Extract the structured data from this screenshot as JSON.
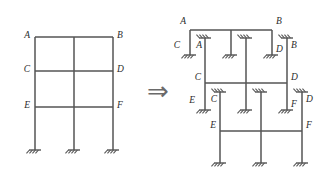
{
  "figure": {
    "type": "structural-engineering-diagram",
    "stroke_color": "#555555",
    "label_color": "#2b2b2b",
    "background": "#ffffff",
    "arrow": {
      "name": "implies-arrow",
      "glyph": "⇒"
    },
    "left_frame": {
      "name": "original-frame",
      "description": "Three-story, two-bay plane frame with three fixed base supports",
      "joint_labels": [
        "A",
        "B",
        "C",
        "D",
        "E",
        "F"
      ],
      "labels": [
        {
          "text": "A",
          "x": 30,
          "y": 38,
          "anchor": "end"
        },
        {
          "text": "B",
          "x": 117,
          "y": 38,
          "anchor": "start"
        },
        {
          "text": "C",
          "x": 30,
          "y": 72,
          "anchor": "end"
        },
        {
          "text": "D",
          "x": 117,
          "y": 72,
          "anchor": "start"
        },
        {
          "text": "E",
          "x": 30,
          "y": 108,
          "anchor": "end"
        },
        {
          "text": "F",
          "x": 117,
          "y": 108,
          "anchor": "start"
        }
      ],
      "columns_x": [
        35,
        74,
        113
      ],
      "beams_y": [
        37,
        71,
        107
      ],
      "base_y": 150,
      "supports": [
        {
          "x": 35,
          "y": 150
        },
        {
          "x": 74,
          "y": 150
        },
        {
          "x": 113,
          "y": 150
        }
      ]
    },
    "right_assembly": {
      "name": "decomposed-substructures",
      "description": "Three one-story substructures, each with fixed supports introduced at the cut column ends",
      "stories": [
        {
          "name": "story-3-substructure",
          "beam_y": 30,
          "beam_x1": 190,
          "beam_x2": 272,
          "columns_x": [
            190,
            231,
            272
          ],
          "column_bottom_y": 55,
          "top_labels": [
            {
              "text": "A",
              "x": 186,
              "y": 24,
              "anchor": "end"
            },
            {
              "text": "B",
              "x": 276,
              "y": 24,
              "anchor": "start"
            }
          ],
          "bottom_labels": [
            {
              "text": "C",
              "x": 180,
              "y": 48,
              "anchor": "end"
            },
            {
              "text": "D",
              "x": 276,
              "y": 52,
              "anchor": "start"
            }
          ],
          "base_supports": [
            {
              "x": 190,
              "y": 55
            },
            {
              "x": 231,
              "y": 55
            },
            {
              "x": 272,
              "y": 55
            }
          ]
        },
        {
          "name": "story-2-substructure",
          "beam_y": 83,
          "beam_x1": 205,
          "beam_x2": 287,
          "columns_x": [
            205,
            246,
            287
          ],
          "column_top_y": 38,
          "column_bottom_y": 110,
          "top_supports": [
            {
              "x": 205,
              "y": 38
            },
            {
              "x": 246,
              "y": 38
            },
            {
              "x": 287,
              "y": 38
            }
          ],
          "top_labels": [
            {
              "text": "A",
              "x": 202,
              "y": 48,
              "anchor": "end"
            },
            {
              "text": "B",
              "x": 291,
              "y": 48,
              "anchor": "start"
            }
          ],
          "mid_labels": [
            {
              "text": "C",
              "x": 201,
              "y": 80,
              "anchor": "end"
            },
            {
              "text": "D",
              "x": 291,
              "y": 80,
              "anchor": "start"
            }
          ],
          "bottom_labels": [
            {
              "text": "E",
              "x": 195,
              "y": 103,
              "anchor": "end"
            },
            {
              "text": "F",
              "x": 291,
              "y": 107,
              "anchor": "start"
            }
          ],
          "base_supports": [
            {
              "x": 205,
              "y": 110
            },
            {
              "x": 246,
              "y": 110
            },
            {
              "x": 287,
              "y": 110
            }
          ]
        },
        {
          "name": "story-1-substructure",
          "beam_y": 131,
          "beam_x1": 220,
          "beam_x2": 302,
          "columns_x": [
            220,
            261,
            302
          ],
          "column_top_y": 92,
          "column_bottom_y": 163,
          "top_supports": [
            {
              "x": 220,
              "y": 92
            },
            {
              "x": 261,
              "y": 92
            },
            {
              "x": 302,
              "y": 92
            }
          ],
          "top_labels": [
            {
              "text": "C",
              "x": 217,
              "y": 102,
              "anchor": "end"
            },
            {
              "text": "D",
              "x": 306,
              "y": 102,
              "anchor": "start"
            }
          ],
          "mid_labels": [
            {
              "text": "E",
              "x": 216,
              "y": 128,
              "anchor": "end"
            },
            {
              "text": "F",
              "x": 306,
              "y": 128,
              "anchor": "start"
            }
          ],
          "base_supports": [
            {
              "x": 220,
              "y": 163
            },
            {
              "x": 261,
              "y": 163
            },
            {
              "x": 302,
              "y": 163
            }
          ]
        }
      ]
    }
  }
}
